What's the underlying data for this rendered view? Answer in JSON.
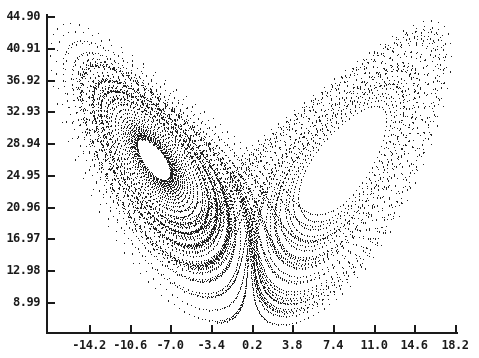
{
  "chart_data": {
    "type": "scatter",
    "title": "",
    "xlabel": "",
    "ylabel": "",
    "system": {
      "sigma": 10,
      "rho": 28,
      "beta": 2.6667,
      "dt": 0.008,
      "steps": 9000,
      "x0": 1.0,
      "y0": 1.0,
      "z0": 1.0
    },
    "xlim": [
      -17.8,
      19.5
    ],
    "ylim": [
      4.0,
      46.5
    ],
    "x_ticks": [
      -14.2,
      -10.6,
      -7.0,
      -3.4,
      0.2,
      3.8,
      7.4,
      11.0,
      14.6,
      18.2
    ],
    "x_tick_labels": [
      "-14.2",
      "-10.6",
      "-7.0",
      "-3.4",
      "0.2",
      "3.8",
      "7.4",
      "11.0",
      "14.6",
      "18.2"
    ],
    "y_ticks": [
      44.9,
      40.91,
      36.92,
      32.93,
      28.94,
      24.95,
      20.96,
      16.97,
      12.98,
      8.99
    ],
    "y_tick_labels": [
      "44.90",
      "40.91",
      "36.92",
      "32.93",
      "28.94",
      "24.95",
      "20.96",
      "16.97",
      "12.98",
      "8.99"
    ],
    "grid": false,
    "legend": null,
    "dot_color": "#222222",
    "axis_color": "#1a1a1a",
    "background": "#ffffff"
  }
}
